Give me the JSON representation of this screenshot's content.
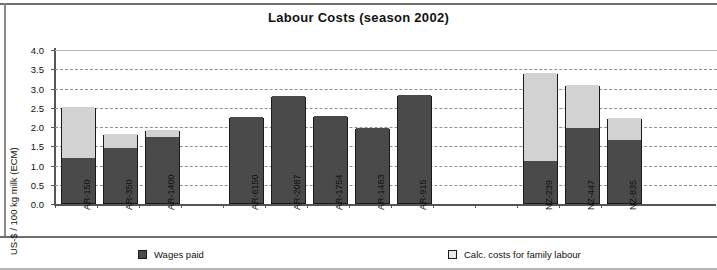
{
  "chart_data": {
    "type": "bar",
    "title": "Labour Costs (season 2002)",
    "xlabel": "",
    "ylabel": "US-$ / 100 kg milk (ECM)",
    "ylim": [
      0.0,
      4.0
    ],
    "ytick_labels": [
      "0.0",
      "0.5",
      "1.0",
      "1.5",
      "2.0",
      "2.5",
      "3.0",
      "3.5",
      "4.0"
    ],
    "ytick_values": [
      0.0,
      0.5,
      1.0,
      1.5,
      2.0,
      2.5,
      3.0,
      3.5,
      4.0
    ],
    "grid": true,
    "grid_style": "dashed-horizontal",
    "stacked": true,
    "legend_position": "bottom",
    "categories": [
      "AR-150",
      "AR-350",
      "AR-1400",
      "",
      "AR-6150",
      "AR-2087",
      "AR-1754",
      "AR-1483",
      "AR-915",
      "",
      "",
      "NZ-239",
      "NZ-447",
      "NZ-835"
    ],
    "series": [
      {
        "name": "Wages paid",
        "color": "#4a4a4a",
        "values": [
          1.17,
          1.42,
          1.72,
          null,
          2.24,
          2.78,
          2.27,
          1.94,
          2.8,
          null,
          null,
          1.09,
          1.96,
          1.63
        ]
      },
      {
        "name": "Calc. costs for family labour",
        "color": "#d2d2d2",
        "values": [
          1.33,
          0.36,
          0.17,
          null,
          0.0,
          0.0,
          0.0,
          0.0,
          0.0,
          null,
          null,
          2.28,
          1.1,
          0.58
        ]
      }
    ],
    "totals": [
      2.5,
      1.78,
      1.89,
      null,
      2.24,
      2.78,
      2.27,
      1.94,
      2.8,
      null,
      null,
      3.37,
      3.06,
      2.21
    ]
  },
  "legend": {
    "items": [
      {
        "label": "Wages paid",
        "swatch": "dark"
      },
      {
        "label": "Calc. costs for family labour",
        "swatch": "light"
      }
    ]
  }
}
